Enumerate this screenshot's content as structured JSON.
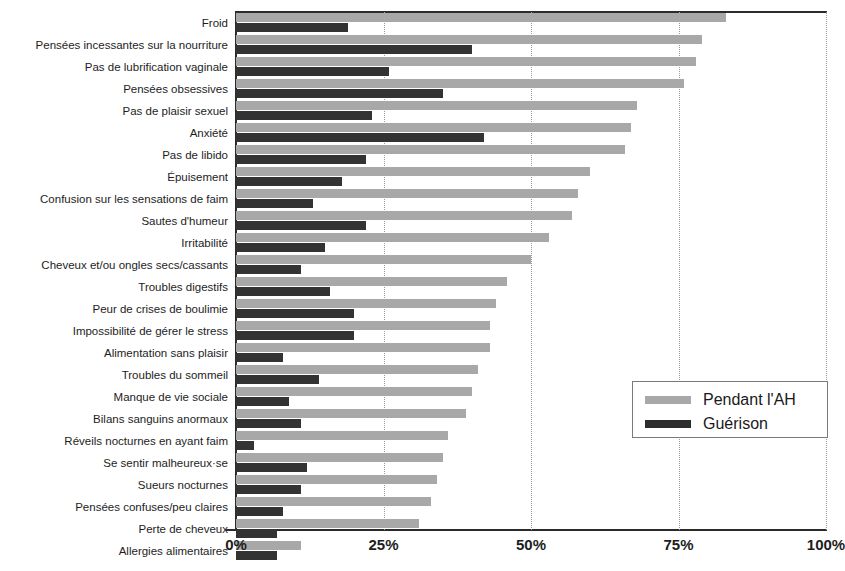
{
  "chart_data": {
    "type": "bar",
    "orientation": "horizontal",
    "title": "",
    "subtitle": "",
    "xlabel": "",
    "ylabel": "",
    "xlim": [
      0,
      100
    ],
    "xticks": [
      "0%",
      "25%",
      "50%",
      "75%",
      "100%"
    ],
    "xtick_values": [
      0,
      25,
      50,
      75,
      100
    ],
    "grid": "vertical-dotted",
    "legend_position": "right-middle",
    "categories": [
      "Froid",
      "Pensées incessantes sur la nourriture",
      "Pas de lubrification vaginale",
      "Pensées obsessives",
      "Pas de plaisir sexuel",
      "Anxiété",
      "Pas de libido",
      "Épuisement",
      "Confusion sur les sensations de faim",
      "Sautes d'humeur",
      "Irritabilité",
      "Cheveux et/ou ongles secs/cassants",
      "Troubles digestifs",
      "Peur de crises de boulimie",
      "Impossibilité de gérer le stress",
      "Alimentation sans plaisir",
      "Troubles du sommeil",
      "Manque de vie sociale",
      "Bilans sanguins anormaux",
      "Réveils nocturnes en ayant faim",
      "Se sentir malheureux·se",
      "Sueurs nocturnes",
      "Pensées confuses/peu claires",
      "Perte de cheveux",
      "Allergies alimentaires"
    ],
    "series": [
      {
        "name": "Pendant l'AH",
        "color": "#a8a8a8",
        "values": [
          83,
          79,
          78,
          76,
          68,
          67,
          66,
          60,
          58,
          57,
          53,
          50,
          46,
          44,
          43,
          43,
          41,
          40,
          39,
          36,
          35,
          34,
          33,
          31,
          11
        ]
      },
      {
        "name": "Guérison",
        "color": "#333333",
        "values": [
          19,
          40,
          26,
          35,
          23,
          42,
          22,
          18,
          13,
          22,
          15,
          11,
          16,
          20,
          20,
          8,
          14,
          9,
          11,
          3,
          12,
          11,
          8,
          7,
          7
        ]
      }
    ]
  },
  "legend": {
    "items": [
      {
        "label": "Pendant l'AH",
        "swatch": "during"
      },
      {
        "label": "Guérison",
        "swatch": "recovery"
      }
    ]
  }
}
